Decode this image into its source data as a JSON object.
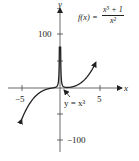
{
  "chart_data": {
    "type": "line",
    "title": "",
    "xlabel": "x",
    "ylabel": "y",
    "xlim": [
      -7,
      8
    ],
    "ylim": [
      -160,
      160
    ],
    "x_ticks": [
      -5,
      5
    ],
    "x_tick_labels": [
      "−5",
      "5"
    ],
    "y_ticks": [
      100,
      -100
    ],
    "y_tick_labels": [
      "100",
      "−100"
    ],
    "grid": false,
    "series": [
      {
        "name": "f(x) = (x^5 + 1)/x^2",
        "function": "x^3 + 1/x^2",
        "vertical_asymptote": 0,
        "color": "#222222"
      },
      {
        "name": "y = x^3",
        "function": "x^3",
        "role": "asymptotic curve",
        "color": "#222222"
      }
    ],
    "annotations": [
      {
        "text": "f(x) = (x^5 + 1)/x^2",
        "position": "upper right"
      },
      {
        "text": "y = x^3",
        "position": "below origin, right",
        "arrow_to": [
          0.5,
          0.1
        ]
      }
    ]
  },
  "labels": {
    "x_axis": "x",
    "y_axis": "y",
    "x_neg": "−5",
    "x_pos": "5",
    "y_pos": "100",
    "y_neg": "−100",
    "fx_prefix": "f(x) =",
    "fx_num": "x⁵ + 1",
    "fx_den": "x²",
    "asym_label": "y = x³"
  }
}
